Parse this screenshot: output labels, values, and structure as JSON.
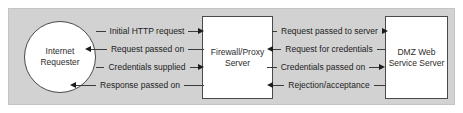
{
  "diagram": {
    "panel_color": "#d2d2d2",
    "nodes": {
      "requester": {
        "shape": "circle",
        "line1": "Internet",
        "line2": "Requester"
      },
      "firewall": {
        "shape": "rectangle",
        "line1": "Firewall/Proxy",
        "line2": "Server"
      },
      "dmz": {
        "shape": "rectangle",
        "line1": "DMZ Web",
        "line2": "Service Server"
      }
    },
    "flows_left": [
      {
        "label": "Initial HTTP request",
        "direction": "right"
      },
      {
        "label": "Request passed on",
        "direction": "left"
      },
      {
        "label": "Credentials supplied",
        "direction": "right"
      },
      {
        "label": "Response passed on",
        "direction": "left"
      }
    ],
    "flows_right": [
      {
        "label": "Request passed to server",
        "direction": "right"
      },
      {
        "label": "Request for credentials",
        "direction": "left"
      },
      {
        "label": "Credentials passed on",
        "direction": "right"
      },
      {
        "label": "Rejection/acceptance",
        "direction": "left"
      }
    ]
  }
}
